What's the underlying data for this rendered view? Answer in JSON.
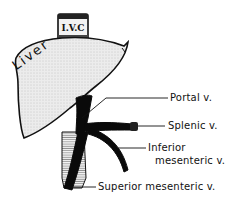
{
  "diagram": {
    "structures": {
      "ivc": "I.V.C",
      "liver": "Liver"
    },
    "labels": [
      {
        "id": "portal",
        "text": "Portal v."
      },
      {
        "id": "splenic",
        "text": "Splenic v."
      },
      {
        "id": "inferior_line1",
        "text": "Inferior"
      },
      {
        "id": "inferior_line2",
        "text": "mesenteric v."
      },
      {
        "id": "superior",
        "text": "Superior mesenteric v."
      }
    ],
    "colors": {
      "outline": "#111111",
      "liver_fill": "#e6e6e6",
      "vein": "#0a0a0a",
      "background": "#ffffff"
    }
  }
}
